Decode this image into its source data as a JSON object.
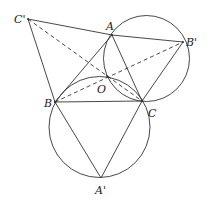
{
  "diagram": {
    "stroke_color": "#333333",
    "background": "#ffffff",
    "points": {
      "A": {
        "label": "A",
        "x": 112,
        "y": 35
      },
      "B": {
        "label": "B",
        "x": 55,
        "y": 102
      },
      "C": {
        "label": "C",
        "x": 142,
        "y": 101
      },
      "O": {
        "label": "O",
        "x": 107,
        "y": 76
      },
      "A1": {
        "label": "A'",
        "x": 101,
        "y": 178
      },
      "B1": {
        "label": "B'",
        "x": 183,
        "y": 42
      },
      "C1": {
        "label": "C'",
        "x": 28,
        "y": 19
      }
    },
    "circles": [
      {
        "name": "circle-ACB'",
        "cx": 146.5,
        "cy": 58.5,
        "r": 43
      },
      {
        "name": "circle-BCA'",
        "cx": 99.5,
        "cy": 127,
        "r": 50.5
      }
    ],
    "solid_segments": [
      [
        "C1",
        "A"
      ],
      [
        "A",
        "B1"
      ],
      [
        "C1",
        "B"
      ],
      [
        "A",
        "B"
      ],
      [
        "A",
        "C"
      ],
      [
        "B",
        "C"
      ],
      [
        "B1",
        "C"
      ],
      [
        "B",
        "A1"
      ],
      [
        "C",
        "A1"
      ]
    ],
    "dashed_segments": [
      [
        "C1",
        "C"
      ],
      [
        "B",
        "B1"
      ]
    ]
  }
}
